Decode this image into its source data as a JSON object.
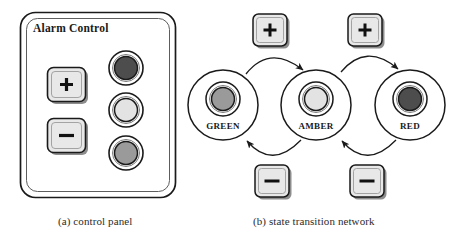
{
  "figure": {
    "panel": {
      "title": "Alarm Control",
      "buttons": [
        {
          "name": "increase",
          "glyph": "+"
        },
        {
          "name": "decrease",
          "glyph": "−"
        }
      ],
      "lights": [
        {
          "name": "red-light",
          "state": "red",
          "color": "#4d4d4d"
        },
        {
          "name": "amber-light",
          "state": "amber",
          "color": "#e3e3e3"
        },
        {
          "name": "green-light",
          "state": "green",
          "color": "#9a9a9a"
        }
      ]
    },
    "network": {
      "states": [
        {
          "label": "GREEN",
          "color": "#9a9a9a"
        },
        {
          "label": "AMBER",
          "color": "#e3e3e3"
        },
        {
          "label": "RED",
          "color": "#4d4d4d"
        }
      ],
      "plus_buttons": [
        {
          "glyph": "+",
          "transition": "green-to-amber"
        },
        {
          "glyph": "+",
          "transition": "amber-to-red"
        }
      ],
      "minus_buttons": [
        {
          "glyph": "−",
          "transition": "amber-to-green"
        },
        {
          "glyph": "−",
          "transition": "red-to-amber"
        }
      ]
    },
    "captions": {
      "a": "(a) control panel",
      "b": "(b) state transition network"
    },
    "colors": {
      "ink": "#1a1a1a",
      "button_face": "#e8e8e8",
      "button_shadow": "#7a7a7a",
      "panel_fill": "#ffffff"
    }
  }
}
